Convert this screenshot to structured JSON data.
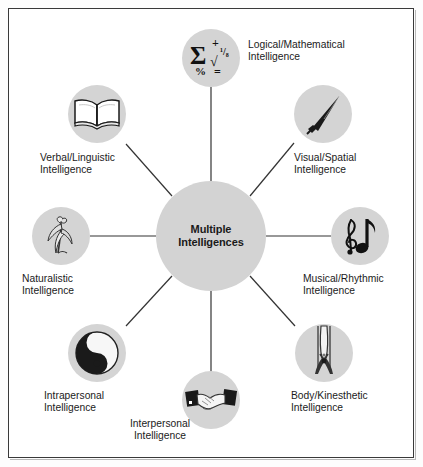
{
  "diagram": {
    "center": {
      "label_line1": "Multiple",
      "label_line2": "Intelligences"
    },
    "colors": {
      "node_fill": "#d4d4d4",
      "center_fill": "#d3d3d3",
      "text": "#1b1b1b",
      "spoke": "#333333",
      "frame": "#3a3a3a",
      "background": "#ffffff"
    },
    "nodes": [
      {
        "id": "logical-mathematical",
        "icon": "math-symbols-icon",
        "icon_glyphs": {
          "sigma": "Σ",
          "plus": "+",
          "fraction": "¹/₈",
          "radical": "√",
          "percent": "%",
          "equals": "="
        },
        "label_line1": "Logical/Mathematical",
        "label_line2": "Intelligence"
      },
      {
        "id": "visual-spatial",
        "icon": "paintbrush-icon",
        "label_line1": "Visual/Spatial",
        "label_line2": "Intelligence"
      },
      {
        "id": "musical-rhythmic",
        "icon": "music-note-icon",
        "label_line1": "Musical/Rhythmic",
        "label_line2": "Intelligence"
      },
      {
        "id": "body-kinesthetic",
        "icon": "dancer-figure-icon",
        "label_line1": "Body/Kinesthetic",
        "label_line2": "Intelligence"
      },
      {
        "id": "interpersonal",
        "icon": "handshake-icon",
        "label_line1": "Interpersonal",
        "label_line2": "Intelligence"
      },
      {
        "id": "intrapersonal",
        "icon": "yin-yang-icon",
        "label_line1": "Intrapersonal",
        "label_line2": "Intelligence"
      },
      {
        "id": "naturalistic",
        "icon": "flower-plant-icon",
        "label_line1": "Naturalistic",
        "label_line2": "Intelligence"
      },
      {
        "id": "verbal-linguistic",
        "icon": "open-book-icon",
        "label_line1": "Verbal/Linguistic",
        "label_line2": "Intelligence"
      }
    ]
  }
}
